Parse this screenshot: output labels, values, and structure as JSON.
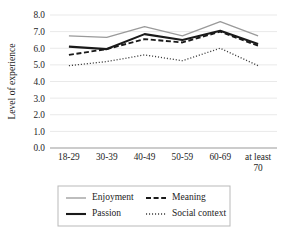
{
  "chart_data": {
    "type": "line",
    "title": "",
    "xlabel": "",
    "ylabel": "Level of experience",
    "categories": [
      "18-29",
      "30-39",
      "40-49",
      "50-59",
      "60-69",
      "at least 70"
    ],
    "ylim": [
      0.0,
      8.0
    ],
    "ytick_step": 1.0,
    "yticks": [
      "0.0",
      "1.0",
      "2.0",
      "3.0",
      "4.0",
      "5.0",
      "6.0",
      "7.0",
      "8.0"
    ],
    "ytick_values": [
      0.0,
      1.0,
      2.0,
      3.0,
      4.0,
      5.0,
      6.0,
      7.0,
      8.0
    ],
    "grid": true,
    "grid_axis": "y",
    "legend_position": "bottom",
    "series": [
      {
        "name": "Enjoyment",
        "values": [
          6.75,
          6.65,
          7.3,
          6.75,
          7.6,
          6.75
        ],
        "style": "solid-light",
        "color": "#9a9a9a",
        "width": 1.3
      },
      {
        "name": "Meaning",
        "values": [
          5.6,
          5.95,
          6.55,
          6.35,
          7.0,
          6.15
        ],
        "style": "dashed",
        "color": "#1a1a1a",
        "width": 1.9
      },
      {
        "name": "Passion",
        "values": [
          6.1,
          5.95,
          6.85,
          6.5,
          7.05,
          6.25
        ],
        "style": "solid-bold",
        "color": "#1a1a1a",
        "width": 2.1
      },
      {
        "name": "Social context",
        "values": [
          4.95,
          5.2,
          5.6,
          5.25,
          6.0,
          4.95
        ],
        "style": "dotted",
        "color": "#3d3d3d",
        "width": 1.3
      }
    ]
  },
  "legend": {
    "entries": [
      {
        "label": "Enjoyment",
        "series": "Enjoyment"
      },
      {
        "label": "Meaning",
        "series": "Meaning"
      },
      {
        "label": "Passion",
        "series": "Passion"
      },
      {
        "label": "Social context",
        "series": "Social context"
      }
    ]
  },
  "colors": {
    "gridline": "#e9e9e9",
    "axis": "#9a9a9a",
    "text": "#232323",
    "legend_border": "#b9b9b9"
  }
}
